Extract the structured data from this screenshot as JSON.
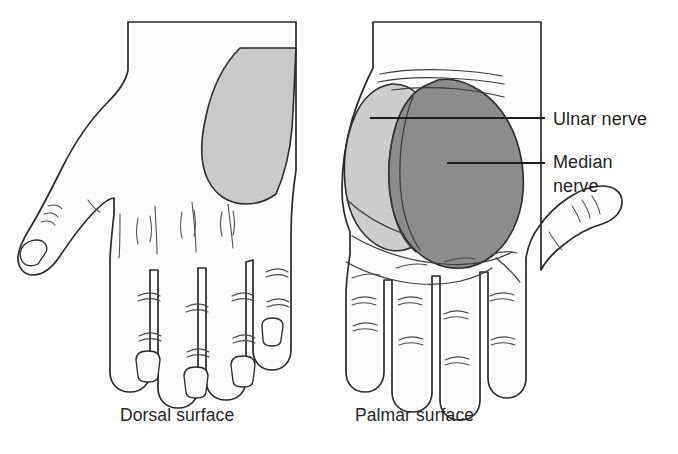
{
  "figure": {
    "background_color": "#ffffff"
  },
  "palette": {
    "outline": "#2b2b2b",
    "skin_fill": "#fdfdfd",
    "ulnar_zone": "#cccccc",
    "median_zone": "#8c8c8c",
    "dorsal_zone": "#c9c9c9",
    "text": "#1f1f1f",
    "leader_line": "#1d1d1d"
  },
  "captions": [
    {
      "id": "dorsal",
      "label": "Dorsal surface",
      "x": 180,
      "y": 421
    },
    {
      "id": "palmar",
      "label": "Palmar surface",
      "x": 415,
      "y": 421
    }
  ],
  "labels": [
    {
      "id": "ulnar-nerve",
      "lines": [
        "Ulnar nerve"
      ],
      "text_x": 553,
      "text_y": 125,
      "leader": {
        "x1": 370,
        "y1": 118,
        "x2": 545,
        "y2": 118
      },
      "zone_color": "#cccccc"
    },
    {
      "id": "median-nerve",
      "lines": [
        "Median",
        "nerve"
      ],
      "text_x": 553,
      "text_y": 168,
      "leader": {
        "x1": 447,
        "y1": 163,
        "x2": 545,
        "y2": 163
      },
      "zone_color": "#8c8c8c"
    }
  ],
  "hands": [
    {
      "id": "dorsal-hand",
      "view": "dorsal",
      "caption": "Dorsal surface",
      "thumb_side": "left",
      "has_fingernails": true,
      "shaded_zones": [
        {
          "nerve": "ulnar",
          "color": "#c9c9c9",
          "region": "dorsomedial border"
        }
      ]
    },
    {
      "id": "palmar-hand",
      "view": "palmar",
      "caption": "Palmar surface",
      "thumb_side": "right",
      "has_fingernails": false,
      "shaded_zones": [
        {
          "nerve": "ulnar",
          "color": "#cccccc",
          "region": "hypothenar eminence"
        },
        {
          "nerve": "median",
          "color": "#8c8c8c",
          "region": "thenar eminence and central palm"
        }
      ]
    }
  ]
}
